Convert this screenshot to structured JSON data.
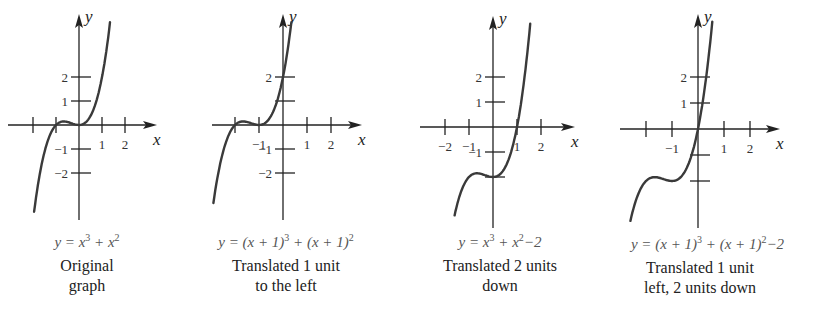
{
  "chart_data": [
    {
      "type": "line",
      "title": "Original graph",
      "equation": "y = x^3 + x^2",
      "caption_lines": [
        "Original",
        "graph"
      ],
      "xlabel": "x",
      "ylabel": "y",
      "x_ticks": [
        -2,
        -1,
        1,
        2
      ],
      "x_tick_labels": [
        "1",
        "2"
      ],
      "y_ticks": [
        -2,
        -1,
        1,
        2
      ],
      "y_tick_labels": [
        "2",
        "1",
        "−1",
        "−2"
      ],
      "xlim": [
        -2,
        3.4
      ],
      "ylim": [
        -4,
        4.6
      ],
      "function": {
        "h": 0,
        "k": 0
      },
      "x_range": [
        -1.95,
        1.35
      ],
      "series": [
        {
          "name": "y = x^3 + x^2",
          "points": [
            [
              -1.9,
              -3.25
            ],
            [
              -1.5,
              -1.13
            ],
            [
              -1,
              0
            ],
            [
              -0.67,
              0.15
            ],
            [
              0,
              0
            ],
            [
              0.5,
              0.38
            ],
            [
              1,
              2
            ],
            [
              1.3,
              3.89
            ]
          ]
        }
      ]
    },
    {
      "type": "line",
      "title": "Translated 1 unit to the left",
      "equation": "y = (x + 1)^3 + (x + 1)^2",
      "caption_lines": [
        "Translated 1 unit",
        "to the left"
      ],
      "xlabel": "x",
      "ylabel": "y",
      "x_ticks": [
        -2,
        -1,
        1,
        2
      ],
      "x_tick_labels": [
        "−1",
        "1",
        "2"
      ],
      "y_ticks": [
        -2,
        -1,
        1,
        2
      ],
      "y_tick_labels": [
        "2",
        "−1",
        "−2"
      ],
      "xlim": [
        -2.5,
        3.4
      ],
      "ylim": [
        -4,
        4.6
      ],
      "function": {
        "h": -1,
        "k": 0
      },
      "x_range": [
        -2.9,
        0.35
      ],
      "series": [
        {
          "name": "y = (x+1)^3 + (x+1)^2",
          "points": [
            [
              -2.9,
              -3.25
            ],
            [
              -2,
              0
            ],
            [
              -1.67,
              0.15
            ],
            [
              -1,
              0
            ],
            [
              -0.5,
              0.38
            ],
            [
              0,
              2
            ],
            [
              0.3,
              3.89
            ]
          ]
        }
      ]
    },
    {
      "type": "line",
      "title": "Translated 2 units down",
      "equation": "y = x^3 + x^2 − 2",
      "caption_lines": [
        "Translated 2 units",
        "down"
      ],
      "xlabel": "x",
      "ylabel": "y",
      "x_ticks": [
        -2,
        -1,
        1,
        2
      ],
      "x_tick_labels": [
        "−2",
        "−1",
        "1",
        "2"
      ],
      "y_ticks": [
        -2,
        -1,
        1,
        2
      ],
      "y_tick_labels": [
        "2",
        "1",
        "−1"
      ],
      "xlim": [
        -2.5,
        3.4
      ],
      "ylim": [
        -4,
        4.6
      ],
      "function": {
        "h": 0,
        "k": -2
      },
      "x_range": [
        -1.6,
        1.55
      ],
      "series": [
        {
          "name": "y = x^3 + x^2 - 2",
          "points": [
            [
              -1.6,
              -3.54
            ],
            [
              -1,
              -2
            ],
            [
              -0.67,
              -1.85
            ],
            [
              0,
              -2
            ],
            [
              0.5,
              -1.63
            ],
            [
              1,
              0
            ],
            [
              1.5,
              3.63
            ]
          ]
        }
      ]
    },
    {
      "type": "line",
      "title": "Translated 1 unit left, 2 units down",
      "equation": "y = (x + 1)^3 + (x + 1)^2 − 2",
      "caption_lines": [
        "Translated 1 unit",
        "left, 2 units down"
      ],
      "xlabel": "x",
      "ylabel": "y",
      "x_ticks": [
        -2,
        -1,
        1,
        2
      ],
      "x_tick_labels": [
        "−1",
        "1",
        "2"
      ],
      "y_ticks": [
        -2,
        -1,
        1,
        2
      ],
      "y_tick_labels": [
        "2",
        "1"
      ],
      "xlim": [
        -2.5,
        3.4
      ],
      "ylim": [
        -4,
        4.6
      ],
      "function": {
        "h": -1,
        "k": -2
      },
      "x_range": [
        -2.6,
        0.55
      ],
      "series": [
        {
          "name": "y = (x+1)^3 + (x+1)^2 - 2",
          "points": [
            [
              -2.6,
              -3.54
            ],
            [
              -2,
              -2
            ],
            [
              -1.67,
              -1.85
            ],
            [
              -1,
              -2
            ],
            [
              -0.5,
              -1.63
            ],
            [
              0,
              0
            ],
            [
              0.5,
              3.63
            ]
          ]
        }
      ]
    }
  ],
  "panels": [
    {
      "eq_parts": [
        "y = x",
        "3",
        " + x",
        "2",
        ""
      ],
      "caption": [
        "Original",
        "graph"
      ],
      "geom": {
        "ox": 79,
        "oy": 125,
        "ux": 23,
        "uy": 24,
        "xmin": 8,
        "xmax": 157,
        "ytop": 14,
        "ybot": 220
      },
      "ticks_x": [
        {
          "v": -2,
          "label": ""
        },
        {
          "v": -1,
          "label": ""
        },
        {
          "v": 1,
          "label": "1"
        },
        {
          "v": 2,
          "label": "2"
        }
      ],
      "ticks_y": [
        {
          "v": 2,
          "label": "2"
        },
        {
          "v": 1,
          "label": "1"
        },
        {
          "v": -1,
          "label": "−1"
        },
        {
          "v": -2,
          "label": "−2"
        }
      ],
      "curve": {
        "h": 0,
        "k": 0,
        "x0": -1.95,
        "x1": 1.35
      },
      "eq_pos": {
        "left": 22,
        "top": 232,
        "width": 130
      },
      "cap_pos": {
        "left": 22,
        "top": 256,
        "width": 130
      }
    },
    {
      "eq_parts": [
        "y = (x + 1)",
        "3",
        " + (x + 1)",
        "2",
        ""
      ],
      "caption": [
        "Translated 1 unit",
        "to the left"
      ],
      "geom": {
        "ox": 283,
        "oy": 125,
        "ux": 24,
        "uy": 24,
        "xmin": 212,
        "xmax": 362,
        "ytop": 14,
        "ybot": 220
      },
      "ticks_x": [
        {
          "v": -2,
          "label": ""
        },
        {
          "v": -1,
          "label": "−1"
        },
        {
          "v": 1,
          "label": "1"
        },
        {
          "v": 2,
          "label": "2"
        }
      ],
      "ticks_y": [
        {
          "v": 2,
          "label": "2"
        },
        {
          "v": 1,
          "label": ""
        },
        {
          "v": -1,
          "label": "−1"
        },
        {
          "v": -2,
          "label": "−2"
        }
      ],
      "curve": {
        "h": -1,
        "k": 0,
        "x0": -2.9,
        "x1": 0.35
      },
      "eq_pos": {
        "left": 186,
        "top": 232,
        "width": 200
      },
      "cap_pos": {
        "left": 196,
        "top": 256,
        "width": 180
      }
    },
    {
      "eq_parts": [
        "y = x",
        "3",
        " + x",
        "2",
        "−2"
      ],
      "caption": [
        "Translated 2 units",
        "down"
      ],
      "geom": {
        "ox": 493,
        "oy": 127,
        "ux": 24,
        "uy": 25,
        "xmin": 420,
        "xmax": 575,
        "ytop": 16,
        "ybot": 228
      },
      "ticks_x": [
        {
          "v": -2,
          "label": "−2"
        },
        {
          "v": -1,
          "label": "−1"
        },
        {
          "v": 1,
          "label": "1"
        },
        {
          "v": 2,
          "label": "2"
        }
      ],
      "ticks_y": [
        {
          "v": 2,
          "label": "2"
        },
        {
          "v": 1,
          "label": "1"
        },
        {
          "v": -1,
          "label": "−1"
        },
        {
          "v": -2,
          "label": ""
        }
      ],
      "curve": {
        "h": 0,
        "k": -2,
        "x0": -1.6,
        "x1": 1.55
      },
      "eq_pos": {
        "left": 420,
        "top": 232,
        "width": 160
      },
      "cap_pos": {
        "left": 415,
        "top": 256,
        "width": 170
      }
    },
    {
      "eq_parts": [
        "y = (x + 1)",
        "3",
        " + (x + 1)",
        "2",
        "−2"
      ],
      "caption": [
        "Translated 1 unit",
        "left, 2 units down"
      ],
      "geom": {
        "ox": 698,
        "oy": 129,
        "ux": 26,
        "uy": 26,
        "xmin": 620,
        "xmax": 780,
        "ytop": 14,
        "ybot": 228
      },
      "ticks_x": [
        {
          "v": -2,
          "label": ""
        },
        {
          "v": -1,
          "label": "−1"
        },
        {
          "v": 1,
          "label": "1"
        },
        {
          "v": 2,
          "label": "2"
        }
      ],
      "ticks_y": [
        {
          "v": 2,
          "label": "2"
        },
        {
          "v": 1,
          "label": "1"
        },
        {
          "v": -1,
          "label": ""
        },
        {
          "v": -2,
          "label": ""
        }
      ],
      "curve": {
        "h": -1,
        "k": -2,
        "x0": -2.6,
        "x1": 0.55
      },
      "eq_pos": {
        "left": 600,
        "top": 234,
        "width": 215
      },
      "cap_pos": {
        "left": 615,
        "top": 258,
        "width": 170
      }
    }
  ],
  "labels": {
    "x": "x",
    "y": "y"
  }
}
